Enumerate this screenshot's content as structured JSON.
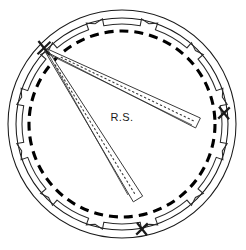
{
  "figure": {
    "type": "technical-line-drawing",
    "canvas": {
      "width": 246,
      "height": 250,
      "background": "#ffffff"
    },
    "labels": [
      {
        "name": "rs-label",
        "text": "R.S.",
        "x": 122,
        "y": 121,
        "font_size": 11
      }
    ],
    "colors": {
      "stroke": "#1a1a1a",
      "thin_stroke": "#3a3a3a",
      "dashed": "#000000",
      "background": "#ffffff",
      "bar_fill": "#ffffff"
    },
    "geometry": {
      "center": {
        "x": 122,
        "y": 124
      },
      "outer_circle_radius": 114,
      "mid_circle_radius": 106,
      "notched_ring_radius": 100,
      "dashed_circle_radius": 93,
      "notch_count": 12,
      "notch_depth": 7,
      "notch_angular_width_deg": 9
    },
    "markers": [
      {
        "name": "x-marker-upper-left",
        "x": 44,
        "y": 48,
        "size": 9,
        "angle_deg": 219
      },
      {
        "name": "x-marker-right",
        "x": 224,
        "y": 113,
        "size": 8,
        "angle_deg": 355
      },
      {
        "name": "x-marker-bottom",
        "x": 142,
        "y": 229,
        "size": 8,
        "angle_deg": 84
      }
    ],
    "bars": [
      {
        "name": "measuring-bar-upper",
        "start": {
          "x": 46,
          "y": 50
        },
        "end": {
          "x": 198,
          "y": 123
        },
        "width": 11,
        "has_dotted_centerline": true
      },
      {
        "name": "measuring-bar-lower",
        "start": {
          "x": 46,
          "y": 50
        },
        "end": {
          "x": 138,
          "y": 199
        },
        "width": 11,
        "has_dotted_centerline": true
      }
    ],
    "dashed_circle": {
      "name": "dashed-reference-circle",
      "dash_pattern": "9 6",
      "stroke_width": 3.1
    }
  }
}
